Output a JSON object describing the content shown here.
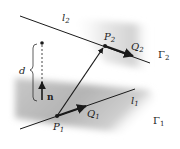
{
  "figure": {
    "lines": {
      "l2": {
        "label": "l",
        "sub": "2"
      },
      "l1": {
        "label": "l",
        "sub": "1"
      }
    },
    "planes": {
      "gamma2": {
        "label": "Γ",
        "sub": "2"
      },
      "gamma1": {
        "label": "Γ",
        "sub": "1"
      }
    },
    "points": {
      "P1": {
        "label": "P",
        "sub": "1"
      },
      "P2": {
        "label": "P",
        "sub": "2"
      }
    },
    "vectors": {
      "Q1": {
        "label": "Q",
        "sub": "1"
      },
      "Q2": {
        "label": "Q",
        "sub": "2"
      },
      "n": {
        "label": "n"
      }
    },
    "distance": {
      "label": "d"
    }
  },
  "colors": {
    "ink": "#1a1a1a",
    "plane_shade": "#b8b8b8",
    "background": "#ffffff"
  }
}
